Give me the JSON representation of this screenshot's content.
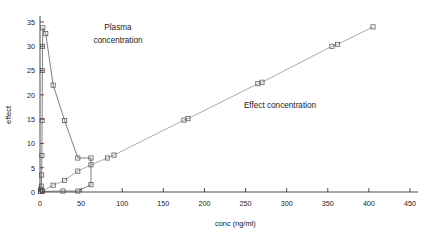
{
  "chart_data": {
    "type": "line",
    "title": "",
    "xlabel": "conc (ng/ml)",
    "ylabel": "effect",
    "xlim": [
      0,
      450
    ],
    "ylim": [
      0,
      35
    ],
    "xticks": [
      0,
      50,
      100,
      150,
      200,
      250,
      300,
      350,
      400,
      450
    ],
    "yticks": [
      0,
      5,
      10,
      15,
      20,
      25,
      30,
      35
    ],
    "xtick_labels": [
      "0",
      "50",
      "100",
      "150",
      "200",
      "250",
      "300",
      "350",
      "400",
      "450"
    ],
    "ytick_labels": [
      "0",
      "5",
      "10",
      "15",
      "20",
      "25",
      "30",
      "35"
    ],
    "grid": false,
    "legend": "none",
    "marker": "open-square",
    "annotations": [
      {
        "text": "Plasma concentration",
        "line1": "Plasma",
        "line2": "concentration",
        "x": 60,
        "y": 31
      },
      {
        "text": "Effect concentration",
        "line1": "Effect concentration",
        "x": 255,
        "y": 13
      }
    ],
    "series": [
      {
        "name": "Plasma concentration",
        "points": [
          [
            0.4,
            0.2
          ],
          [
            1.0,
            0.6
          ],
          [
            1.6,
            1.2
          ],
          [
            2.0,
            3.5
          ],
          [
            2.3,
            7.5
          ],
          [
            2.6,
            14.7
          ],
          [
            2.9,
            25.0
          ],
          [
            3.1,
            30.0
          ],
          [
            3.4,
            33.8
          ],
          [
            7.0,
            32.6
          ],
          [
            16.0,
            22.0
          ],
          [
            30.0,
            14.7
          ],
          [
            46.0,
            7.0
          ],
          [
            62.0,
            7.0
          ],
          [
            62.0,
            1.5
          ],
          [
            46.0,
            0.2
          ],
          [
            28.0,
            0.2
          ],
          [
            3.0,
            0.1
          ]
        ]
      },
      {
        "name": "Effect concentration",
        "points": [
          [
            1.0,
            0.1
          ],
          [
            3.0,
            0.2
          ],
          [
            16.0,
            1.4
          ],
          [
            30.0,
            2.4
          ],
          [
            46.0,
            4.3
          ],
          [
            62.0,
            5.6
          ],
          [
            82.0,
            7.0
          ],
          [
            90.0,
            7.6
          ],
          [
            175.0,
            14.8
          ],
          [
            180.0,
            15.1
          ],
          [
            265.0,
            22.3
          ],
          [
            270.0,
            22.6
          ],
          [
            355.0,
            30.0
          ],
          [
            362.0,
            30.4
          ],
          [
            405.0,
            34.0
          ]
        ]
      }
    ]
  }
}
